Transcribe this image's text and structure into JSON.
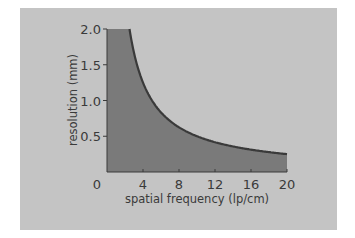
{
  "chart_data": {
    "type": "area",
    "title": "",
    "xlabel": "spatial frequency (lp/cm)",
    "ylabel": "resolution (mm)",
    "xlim": [
      0,
      20
    ],
    "ylim": [
      0,
      2.0
    ],
    "x_ticks": [
      "0",
      "4",
      "8",
      "12",
      "16",
      "20"
    ],
    "y_ticks": [
      "0.5",
      "1.0",
      "1.5",
      "2.0"
    ],
    "grid": false,
    "legend": null,
    "series": [
      {
        "name": "resolution",
        "x": [
          0,
          2.5,
          3,
          4,
          5,
          6,
          8,
          10,
          12,
          14,
          16,
          18,
          20
        ],
        "values": [
          2.0,
          2.0,
          1.67,
          1.25,
          1.0,
          0.83,
          0.63,
          0.5,
          0.42,
          0.36,
          0.31,
          0.28,
          0.25
        ]
      }
    ],
    "colors": {
      "background": "#c4c4c4",
      "fill": "#7a7a7a",
      "curve": "#3a3a3a",
      "text": "#3a3a3a"
    }
  }
}
